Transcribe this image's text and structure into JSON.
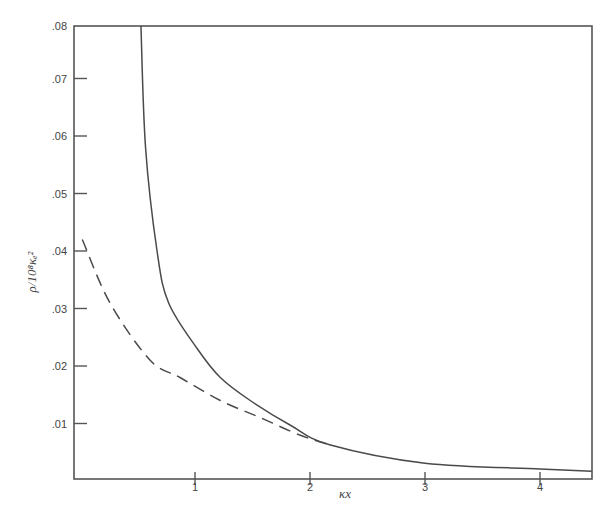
{
  "chart_data": {
    "type": "line",
    "title": "",
    "xlabel": "κx",
    "ylabel": "ρ/10⁸κₑ²",
    "xlim": [
      -0.05,
      4.5
    ],
    "ylim": [
      0,
      0.08
    ],
    "grid": false,
    "legend": null,
    "x_ticks": [
      1,
      2,
      3,
      4
    ],
    "x_tick_labels": [
      "1",
      "2",
      "3",
      "4"
    ],
    "y_ticks": [
      0.01,
      0.02,
      0.03,
      0.04,
      0.05,
      0.06,
      0.07,
      0.08
    ],
    "y_tick_labels": [
      ".01",
      ".02",
      ".03",
      ".04",
      ".05",
      ".06",
      ".07",
      ".08"
    ],
    "series": [
      {
        "name": "solid",
        "style": "solid",
        "x": [
          0.53,
          0.57,
          0.67,
          0.77,
          1.02,
          1.22,
          1.48,
          1.83,
          2.17,
          3.0,
          4.0,
          4.45
        ],
        "y": [
          0.08,
          0.058,
          0.04,
          0.031,
          0.023,
          0.018,
          0.014,
          0.0097,
          0.0063,
          0.0031,
          0.0021,
          0.0017
        ]
      },
      {
        "name": "dashed",
        "style": "dashed",
        "x": [
          0.02,
          0.26,
          0.61,
          0.87,
          1.22,
          1.57,
          1.91,
          2.17
        ],
        "y": [
          0.042,
          0.031,
          0.021,
          0.018,
          0.014,
          0.011,
          0.008,
          0.0063
        ]
      }
    ]
  },
  "colors": {
    "line": "#4a4a4a",
    "axis": "#555555"
  }
}
